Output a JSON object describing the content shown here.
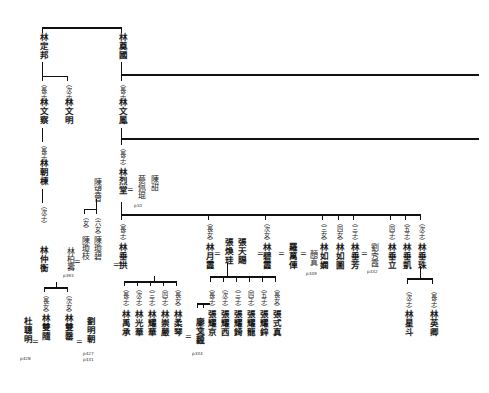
{
  "chart": {
    "type": "genealogy-tree",
    "orientation": "vertical-cjk-text",
    "generations": [
      {
        "level": 1,
        "members": [
          {
            "id": "lin-dingbang",
            "name": "林定邦",
            "ordinal": ""
          },
          {
            "id": "lin-dianguo",
            "name": "林奠國",
            "ordinal": ""
          }
        ]
      },
      {
        "level": 2,
        "members": [
          {
            "id": "lin-wencha",
            "name": "林文察",
            "ordinal": "（長子）"
          },
          {
            "id": "lin-wenming",
            "name": "林文明",
            "ordinal": "（次子）"
          },
          {
            "id": "lin-wenfeng",
            "name": "林文鳳",
            "ordinal": "（長子）"
          }
        ]
      },
      {
        "level": 3,
        "members": [
          {
            "id": "lin-chaodong",
            "name": "林朝棟",
            "ordinal": "（長子）"
          },
          {
            "id": "lin-lietang",
            "name": "林烈堂",
            "ordinal": "（長子）"
          }
        ]
      },
      {
        "level": 4,
        "members": [
          {
            "id": "lin-zhonghen",
            "name": "林仲衡",
            "ordinal": "（次子）"
          },
          {
            "id": "lin-chuigong",
            "name": "林垂拱",
            "ordinal": "（長子）"
          }
        ]
      }
    ],
    "spouses": [
      {
        "id": "cai-peikun",
        "name": "蔡佩琨",
        "page": "p10"
      },
      {
        "id": "chen-tian",
        "name": "陳甜",
        "page": ""
      },
      {
        "id": "chen-wangzeng",
        "name": "陳望曾",
        "page": ""
      },
      {
        "id": "chen-qiongbi",
        "name": "陳瓊碧",
        "ordinal": "（六女）"
      },
      {
        "id": "chen-qiongzhi",
        "name": "陳瓊枝",
        "ordinal": "（女）"
      },
      {
        "id": "lin-baishou",
        "name": "林柏壽",
        "page": "p393"
      },
      {
        "id": "du-congming",
        "name": "杜聰明",
        "page": "p428"
      },
      {
        "id": "liu-mingchao",
        "name": "劉明朝",
        "page": "p427\np431"
      },
      {
        "id": "zhang-huangui",
        "name": "張煥珪",
        "page": ""
      },
      {
        "id": "zhang-tianci",
        "name": "張天賜",
        "page": ""
      },
      {
        "id": "luo-wanche",
        "name": "羅萬俥",
        "page": ""
      },
      {
        "id": "yan-zhen",
        "name": "顏真",
        "page": "p349"
      },
      {
        "id": "liu-xiuxia",
        "name": "劉秀霞",
        "page": "p332"
      },
      {
        "id": "liao-wenyi",
        "name": "廖文毅",
        "page": "p334"
      },
      {
        "id": "liao-wenjin",
        "name": "廖溫進",
        "page": ""
      }
    ],
    "nodes": {
      "lin_dingbang": {
        "name": "林定邦"
      },
      "lin_dianguo": {
        "name": "林奠國"
      },
      "lin_wencha": {
        "ordinal": "（長子）",
        "name": "林文察"
      },
      "lin_wenming": {
        "ordinal": "（次子）",
        "name": "林文明"
      },
      "lin_wenfeng": {
        "ordinal": "（長子）",
        "name": "林文鳳"
      },
      "lin_chaodong": {
        "ordinal": "（長子）",
        "name": "林朝棟"
      },
      "lin_zhonghen": {
        "ordinal": "（次子）",
        "name": "林仲衡"
      },
      "lin_lietang": {
        "ordinal": "（長子）",
        "name": "林烈堂"
      },
      "cai_peikun": {
        "name": "蔡佩琨",
        "page": "p10"
      },
      "chen_tian": {
        "name": "陳甜"
      },
      "chen_wangzeng": {
        "name": "陳望曾"
      },
      "chen_qiongbi": {
        "ordinal": "（六女）",
        "name": "陳瓊碧"
      },
      "chen_qiongzhi": {
        "ordinal": "（女）",
        "name": "陳瓊枝"
      },
      "lin_baishou": {
        "name": "林柏壽",
        "page": "p393"
      },
      "lin_shuangsui": {
        "ordinal": "（長女）",
        "name": "林雙隨"
      },
      "lin_shuangqing": {
        "ordinal": "（次女）",
        "name": "林雙罄"
      },
      "du_congming": {
        "name": "杜聰明",
        "page": "p428"
      },
      "liu_mingchao": {
        "name": "劉明朝",
        "page1": "p427",
        "page2": "p431"
      },
      "lin_chuigong": {
        "ordinal": "（長子）",
        "name": "林垂拱"
      },
      "lin_yucheng": {
        "ordinal": "（長子）",
        "name": "林禹承"
      },
      "lin_guanghua": {
        "ordinal": "（次子）",
        "name": "林光華"
      },
      "lin_yaohua": {
        "ordinal": "（三子）",
        "name": "林耀華"
      },
      "lin_chongyan": {
        "ordinal": "（四子）",
        "name": "林崇嚴"
      },
      "lin_rouqin": {
        "ordinal": "（長女）",
        "name": "林柔琴"
      },
      "liao_wenjin": {
        "name": "廖溫進"
      },
      "liao_wenyi": {
        "name": "廖文毅",
        "page": "p334"
      },
      "lin_yuexia": {
        "ordinal": "（長女）",
        "name": "林月霞"
      },
      "zhang_huangui": {
        "name": "張煥珪"
      },
      "zhang_tianci": {
        "name": "張天賜"
      },
      "lin_bixia": {
        "ordinal": "（次女）",
        "name": "林碧霞"
      },
      "luo_wanche": {
        "name": "羅萬俥"
      },
      "yan_zhen": {
        "name": "顏真",
        "page": "p349"
      },
      "lin_ruxian": {
        "ordinal": "（三女）",
        "name": "林如嫻"
      },
      "lin_rutu": {
        "ordinal": "（四女）",
        "name": "林如圖"
      },
      "lin_chuifang": {
        "ordinal": "（三子）",
        "name": "林垂芳"
      },
      "liu_xiuxia": {
        "name": "劉秀霞",
        "page": "p332"
      },
      "lin_chuili": {
        "ordinal": "（四子）",
        "name": "林垂立"
      },
      "lin_chuikai": {
        "ordinal": "（五子）",
        "name": "林垂凱"
      },
      "lin_chuizhu": {
        "ordinal": "（次子）",
        "name": "林垂珠"
      },
      "zhang_yaojing": {
        "ordinal": "（長子）",
        "name": "張耀京"
      },
      "zhang_yaoxi": {
        "ordinal": "（次子）",
        "name": "張耀西"
      },
      "zhang_yaoqi": {
        "ordinal": "（三子）",
        "name": "張耀錡"
      },
      "zhang_yaolong": {
        "ordinal": "（四子）",
        "name": "張耀龍"
      },
      "zhang_yaoxin": {
        "ordinal": "（五子）",
        "name": "張耀鋅"
      },
      "zhang_shizhen": {
        "ordinal": "（長女）",
        "name": "張式真"
      },
      "lin_yingqing": {
        "ordinal": "（長子）",
        "name": "林英卿"
      },
      "lin_xingdou": {
        "ordinal": "（次子）",
        "name": "林星斗"
      }
    },
    "marriage_symbol": "=",
    "colors": {
      "line": "#111111",
      "text": "#1a1a1a",
      "background": "#ffffff"
    }
  }
}
